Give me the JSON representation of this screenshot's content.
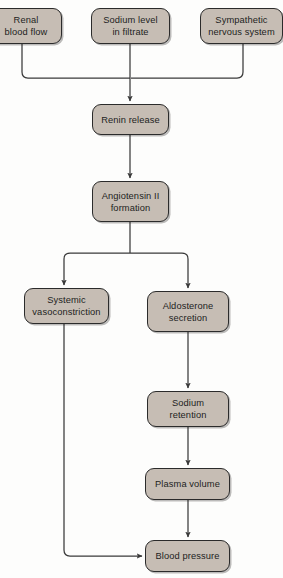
{
  "diagram": {
    "background_color": "#fdfdfc",
    "node_fill_color": "#c6bdb4",
    "node_border_color": "#2b2b2b",
    "edge_color": "#3a3a3a",
    "nodes": [
      {
        "id": "renal_blood_flow",
        "label": "Renal\nblood flow",
        "x": -10,
        "y": 8,
        "w": 72,
        "h": 36
      },
      {
        "id": "sodium_level",
        "label": "Sodium level\nin filtrate",
        "x": 91,
        "y": 8,
        "w": 79,
        "h": 36
      },
      {
        "id": "sympathetic_nervous",
        "label": "Sympathetic\nnervous system",
        "x": 200,
        "y": 8,
        "w": 83,
        "h": 36
      },
      {
        "id": "renin_release",
        "label": "Renin release",
        "x": 92,
        "y": 104,
        "w": 77,
        "h": 31
      },
      {
        "id": "angiotensin_formation",
        "label": "Angiotensin II\nformation",
        "x": 92,
        "y": 181,
        "w": 77,
        "h": 41
      },
      {
        "id": "systemic_vasoconstriction",
        "label": "Systemic\nvasoconstriction",
        "x": 24,
        "y": 288,
        "w": 85,
        "h": 36
      },
      {
        "id": "aldosterone_secretion",
        "label": "Aldosterone\nsecretion",
        "x": 147,
        "y": 291,
        "w": 82,
        "h": 41
      },
      {
        "id": "sodium_retention",
        "label": "Sodium\nretention",
        "x": 147,
        "y": 391,
        "w": 82,
        "h": 36
      },
      {
        "id": "plasma_volume",
        "label": "Plasma volume",
        "x": 145,
        "y": 468,
        "w": 85,
        "h": 32
      },
      {
        "id": "blood_pressure",
        "label": "Blood pressure",
        "x": 145,
        "y": 540,
        "w": 85,
        "h": 32
      }
    ],
    "edges": [
      {
        "id": "renal-to-bus",
        "from": "renal_blood_flow",
        "to": "bus",
        "kind": "elbow-down-right",
        "arrow": false
      },
      {
        "id": "sodium-to-renin",
        "from": "sodium_level",
        "to": "renin_release",
        "kind": "straight-down",
        "arrow": true
      },
      {
        "id": "sympathetic-to-bus",
        "from": "sympathetic_nervous",
        "to": "bus",
        "kind": "elbow-down-left",
        "arrow": false
      },
      {
        "id": "renin-to-angiotensin",
        "from": "renin_release",
        "to": "angiotensin_formation",
        "kind": "straight-down",
        "arrow": true
      },
      {
        "id": "angiotensin-to-vaso",
        "from": "angiotensin_formation",
        "to": "systemic_vasoconstriction",
        "kind": "split-left",
        "arrow": true
      },
      {
        "id": "angiotensin-to-aldo",
        "from": "angiotensin_formation",
        "to": "aldosterone_secretion",
        "kind": "split-right",
        "arrow": true
      },
      {
        "id": "aldo-to-sodium-ret",
        "from": "aldosterone_secretion",
        "to": "sodium_retention",
        "kind": "straight-down",
        "arrow": true
      },
      {
        "id": "sodium-ret-to-plasma",
        "from": "sodium_retention",
        "to": "plasma_volume",
        "kind": "straight-down",
        "arrow": true
      },
      {
        "id": "plasma-to-bp",
        "from": "plasma_volume",
        "to": "blood_pressure",
        "kind": "straight-down",
        "arrow": true
      },
      {
        "id": "vaso-to-bp",
        "from": "systemic_vasoconstriction",
        "to": "blood_pressure",
        "kind": "elbow-down-right",
        "arrow": true
      }
    ]
  }
}
